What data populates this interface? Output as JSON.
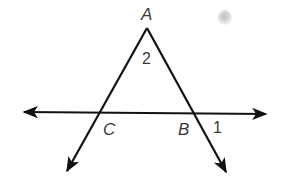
{
  "diagram": {
    "type": "geometry",
    "points": {
      "A": {
        "label": "A",
        "x": 147,
        "y": 28
      },
      "B": {
        "label": "B",
        "x": 194,
        "y": 112
      },
      "C": {
        "label": "C",
        "x": 100,
        "y": 112
      }
    },
    "angles": [
      {
        "label": "2",
        "at": "A",
        "description": "interior angle at vertex A"
      },
      {
        "label": "1",
        "at": "B",
        "description": "exterior angle at B, between ray BA extension and line to right"
      }
    ],
    "colors": {
      "line": "#111111",
      "label": "#3a3a3a",
      "background": "#ffffff"
    }
  }
}
